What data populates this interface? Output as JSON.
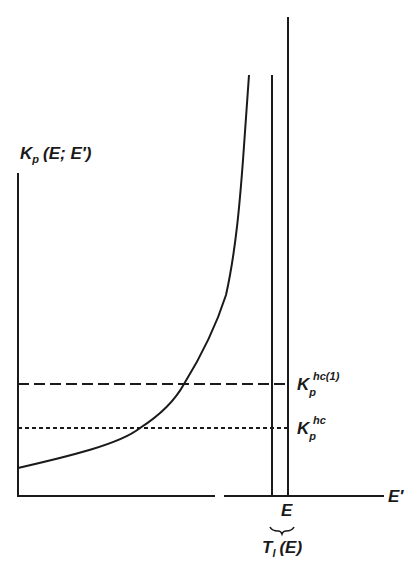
{
  "diagram": {
    "y_axis_label": {
      "main": "K",
      "sub": "p",
      "args": "(E; E′)"
    },
    "x_axis_label": "E′",
    "x_tick_label": "E",
    "brace_label": {
      "main": "T",
      "sub": "l",
      "args": "(E)"
    },
    "levels": [
      {
        "name": "K_p^hc(1)",
        "main": "K",
        "sub": "p",
        "sup": "hc(1)",
        "style": "dashed"
      },
      {
        "name": "K_p^hc",
        "main": "K",
        "sub": "p",
        "sup": "hc",
        "style": "dotted"
      }
    ],
    "colors": {
      "ink": "#1a1a1a",
      "background": "#ffffff"
    }
  }
}
